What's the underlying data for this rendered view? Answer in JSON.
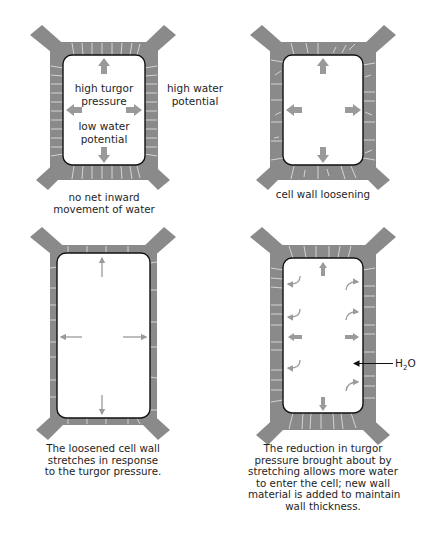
{
  "diagram": {
    "title": "",
    "colors": {
      "wall": "#8a8a8a",
      "wall_lines": "#e8e8e8",
      "membrane": "#111111",
      "arrow": "#9a9a9a",
      "h2o_arrow": "#111111",
      "background": "#ffffff"
    },
    "panels": [
      {
        "id": "panel-1",
        "position": "top-left",
        "inner_labels": [
          {
            "line1": "high turgor",
            "line2": "pressure"
          },
          {
            "line1": "low water",
            "line2": "potential"
          }
        ],
        "outer_label": {
          "line1": "high water",
          "line2": "potential"
        },
        "caption": {
          "line1": "no net inward",
          "line2": "movement of water"
        }
      },
      {
        "id": "panel-2",
        "position": "top-right",
        "caption": {
          "line1": "cell wall loosening"
        }
      },
      {
        "id": "panel-3",
        "position": "bottom-left",
        "caption": {
          "line1": "The loosened cell wall",
          "line2": "stretches in response",
          "line3": "to the turgor pressure."
        }
      },
      {
        "id": "panel-4",
        "position": "bottom-right",
        "h2o_label": {
          "base": "H",
          "subscript": "2",
          "tail": "O"
        },
        "caption": {
          "line1": "The reduction in turgor",
          "line2": "pressure brought about by",
          "line3": "stretching allows more water",
          "line4": "to enter the cell; new wall",
          "line5": "material is added to maintain",
          "line6": "wall thickness."
        }
      }
    ]
  }
}
